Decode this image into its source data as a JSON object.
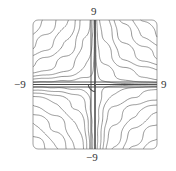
{
  "chart_data": {
    "type": "contour",
    "title": "",
    "xlabel": "",
    "ylabel": "",
    "xlim": [
      -9,
      9
    ],
    "ylim": [
      -9,
      9
    ],
    "tick_labels": {
      "top": "9",
      "bottom": "-9",
      "left": "-9",
      "right": "9"
    },
    "grid": false,
    "legend": null,
    "function_approx": "x*y + 3*sin(x)*sin(y)... (approximate)",
    "levels": [
      -64,
      -49,
      -36,
      -25,
      -16,
      -9,
      -4,
      -1,
      0,
      1,
      4,
      9,
      16,
      25,
      36,
      49,
      64
    ],
    "frame": {
      "corner_radius": "rounded"
    },
    "colors": {
      "contour": "#6a6a6a",
      "axis_contour": "#444444",
      "frame": "#777777"
    }
  },
  "labels": {
    "top": "9",
    "bottom": "−9",
    "left": "−9",
    "right": "9"
  }
}
